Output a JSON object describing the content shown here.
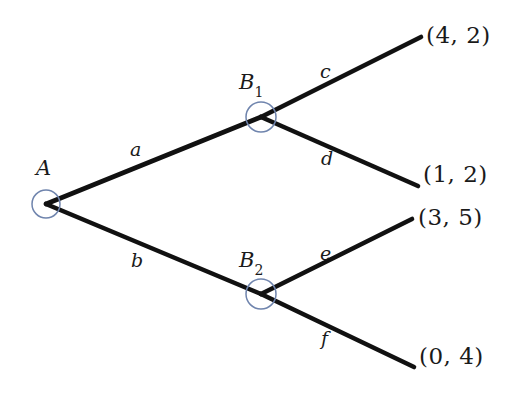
{
  "diagram": {
    "type": "game-tree",
    "title": "",
    "background_color": "#ffffff",
    "edge_color": "#111111",
    "node_stroke_color": "#6f84ad",
    "node_fill_color": "none",
    "nodes": [
      {
        "id": "A",
        "label": "A",
        "subscript": "",
        "x": 46,
        "y": 204,
        "r": 14,
        "label_x": 36,
        "label_y": 158
      },
      {
        "id": "B1",
        "label": "B",
        "subscript": "1",
        "x": 261,
        "y": 117,
        "r": 15,
        "label_x": 239,
        "label_y": 72
      },
      {
        "id": "B2",
        "label": "B",
        "subscript": "2",
        "x": 261,
        "y": 294,
        "r": 15,
        "label_x": 239,
        "label_y": 250
      }
    ],
    "edges": [
      {
        "id": "a",
        "label": "a",
        "from": "A",
        "to": "B1",
        "x1": 46,
        "y1": 204,
        "x2": 261,
        "y2": 117,
        "label_x": 130,
        "label_y": 140
      },
      {
        "id": "b",
        "label": "b",
        "from": "A",
        "to": "B2",
        "x1": 46,
        "y1": 204,
        "x2": 261,
        "y2": 294,
        "label_x": 131,
        "label_y": 251
      },
      {
        "id": "c",
        "label": "c",
        "from": "B1",
        "to": "t1",
        "x1": 261,
        "y1": 117,
        "x2": 421,
        "y2": 37,
        "label_x": 320,
        "label_y": 62
      },
      {
        "id": "d",
        "label": "d",
        "from": "B1",
        "to": "t2",
        "x1": 261,
        "y1": 117,
        "x2": 418,
        "y2": 186,
        "label_x": 321,
        "label_y": 149
      },
      {
        "id": "e",
        "label": "e",
        "from": "B2",
        "to": "t3",
        "x1": 261,
        "y1": 294,
        "x2": 412,
        "y2": 219,
        "label_x": 320,
        "label_y": 244
      },
      {
        "id": "f",
        "label": "f",
        "from": "B2",
        "to": "t4",
        "x1": 261,
        "y1": 294,
        "x2": 414,
        "y2": 367,
        "label_x": 321,
        "label_y": 329
      }
    ],
    "terminals": [
      {
        "id": "t1",
        "label": "(4, 2)",
        "payoff_player_1": 4,
        "payoff_player_2": 2,
        "x": 426,
        "y": 24
      },
      {
        "id": "t2",
        "label": "(1, 2)",
        "payoff_player_1": 1,
        "payoff_player_2": 2,
        "x": 423,
        "y": 163
      },
      {
        "id": "t3",
        "label": "(3, 5)",
        "payoff_player_1": 3,
        "payoff_player_2": 5,
        "x": 418,
        "y": 206
      },
      {
        "id": "t4",
        "label": "(0, 4)",
        "payoff_player_1": 0,
        "payoff_player_2": 4,
        "x": 419,
        "y": 345
      }
    ]
  }
}
